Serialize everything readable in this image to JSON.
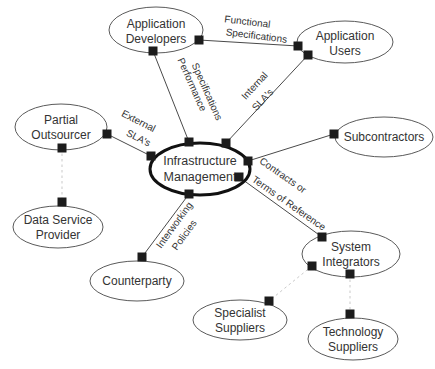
{
  "diagram": {
    "type": "relationship-map",
    "center_node": "Infrastructure Management"
  },
  "colors": {
    "background": "#ffffff",
    "node_stroke": "#5a5a5a",
    "center_stroke": "#111111",
    "line": "#4a4a4a",
    "dashed_line": "#c9c9c9",
    "square": "#1c1c1c",
    "text": "#333333"
  },
  "nodes": [
    {
      "id": "application-developers",
      "lines": [
        "Application",
        "Developers"
      ]
    },
    {
      "id": "application-users",
      "lines": [
        "Application",
        "Users"
      ]
    },
    {
      "id": "subcontractors",
      "lines": [
        "Subcontractors"
      ]
    },
    {
      "id": "partial-outsourcer",
      "lines": [
        "Partial",
        "Outsourcer"
      ]
    },
    {
      "id": "data-service-provider",
      "lines": [
        "Data Service",
        "Provider"
      ]
    },
    {
      "id": "infrastructure-management",
      "lines": [
        "Infrastructure",
        "Management"
      ]
    },
    {
      "id": "counterparty",
      "lines": [
        "Counterparty"
      ]
    },
    {
      "id": "system-integrators",
      "lines": [
        "System",
        "Integrators"
      ]
    },
    {
      "id": "specialist-suppliers",
      "lines": [
        "Specialist",
        "Suppliers"
      ]
    },
    {
      "id": "technology-suppliers",
      "lines": [
        "Technology",
        "Suppliers"
      ]
    }
  ],
  "edges": [
    {
      "from": "application-developers",
      "to": "application-users",
      "label": "Functional Specifications",
      "style": "solid"
    },
    {
      "from": "application-developers",
      "to": "infrastructure-management",
      "label": "Performance Specifications",
      "style": "solid"
    },
    {
      "from": "application-users",
      "to": "infrastructure-management",
      "label": "Internal SLA's",
      "style": "solid"
    },
    {
      "from": "partial-outsourcer",
      "to": "infrastructure-management",
      "label": "External SLA's",
      "style": "solid"
    },
    {
      "from": "infrastructure-management",
      "to": "subcontractors",
      "label": "",
      "style": "solid"
    },
    {
      "from": "infrastructure-management",
      "to": "system-integrators",
      "label": "Contracts or Terms of Reference",
      "style": "solid"
    },
    {
      "from": "infrastructure-management",
      "to": "counterparty",
      "label": "Interworking Policies",
      "style": "solid"
    },
    {
      "from": "partial-outsourcer",
      "to": "data-service-provider",
      "label": "",
      "style": "dashed"
    },
    {
      "from": "system-integrators",
      "to": "specialist-suppliers",
      "label": "",
      "style": "dashed"
    },
    {
      "from": "system-integrators",
      "to": "technology-suppliers",
      "label": "",
      "style": "dashed"
    }
  ],
  "edge_labels": [
    {
      "id": "functional-specifications",
      "lines": [
        "Functional",
        "Specifications"
      ]
    },
    {
      "id": "performance-specifications",
      "lines": [
        "Performance",
        "Specifications"
      ]
    },
    {
      "id": "internal-slas",
      "lines": [
        "Internal",
        "SLA's"
      ]
    },
    {
      "id": "external-slas",
      "lines": [
        "External",
        "SLA's"
      ]
    },
    {
      "id": "contracts-terms",
      "lines": [
        "Contracts or",
        "Terms of Reference"
      ]
    },
    {
      "id": "interworking-policies",
      "lines": [
        "Interworking",
        "Policies"
      ]
    }
  ]
}
